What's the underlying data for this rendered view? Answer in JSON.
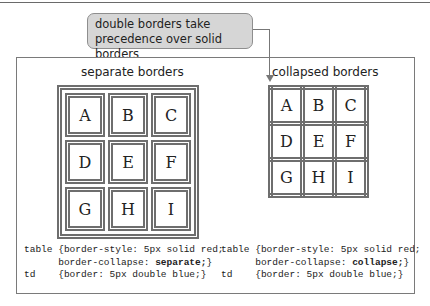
{
  "callout": {
    "line1": "double borders take",
    "line2": "precedence over solid borders"
  },
  "left": {
    "title": "separate borders",
    "cells": [
      [
        "A",
        "B",
        "C"
      ],
      [
        "D",
        "E",
        "F"
      ],
      [
        "G",
        "H",
        "I"
      ]
    ],
    "code": {
      "l1_sel": "table",
      "l1_rule": "{border-style: 5px solid red;",
      "l2_prop": "border-collapse: ",
      "l2_val": "separate;",
      "l2_end": "}",
      "l3_sel": "td",
      "l3_rule": "{border: 5px double blue;}"
    }
  },
  "right": {
    "title": "collapsed borders",
    "cells": [
      [
        "A",
        "B",
        "C"
      ],
      [
        "D",
        "E",
        "F"
      ],
      [
        "G",
        "H",
        "I"
      ]
    ],
    "code": {
      "l1_sel": "table",
      "l1_rule": "{border-style: 5px solid red;",
      "l2_prop": "border-collapse: ",
      "l2_val": "collapse;",
      "l2_end": "}",
      "l3_sel": "td",
      "l3_rule": "{border: 5px double blue;}"
    }
  },
  "colors": {
    "border_gray": "#6e6e6e",
    "callout_bg": "#d6d6d6",
    "frame": "#7a7a7a"
  }
}
